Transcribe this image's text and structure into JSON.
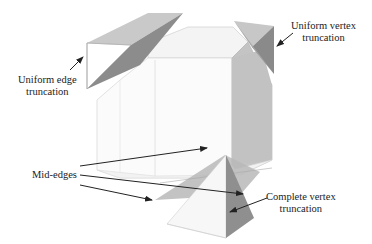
{
  "figure": {
    "type": "cube-truncation-diagram",
    "colors": {
      "background": "#ffffff",
      "cube_edge": "#cfcfcf",
      "light_face": "#e2e2e2",
      "mid_face": "#bdbdbd",
      "dark_face": "#8a8a8a",
      "arrow": "#222222",
      "text": "#222222"
    }
  },
  "labels": {
    "uniform_edge": {
      "line1": "Uniform edge",
      "line2": "truncation"
    },
    "uniform_vertex": {
      "line1": "Uniform vertex",
      "line2": "truncation"
    },
    "mid_edges": {
      "line1": "Mid-edges"
    },
    "complete_vertex": {
      "line1": "Complete vertex",
      "line2": "truncation"
    }
  }
}
